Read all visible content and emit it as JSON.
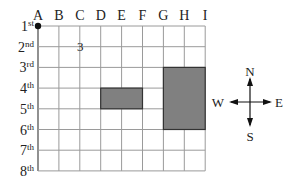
{
  "grid": {
    "columns": [
      "A",
      "B",
      "C",
      "D",
      "E",
      "F",
      "G",
      "H",
      "I"
    ],
    "rows": [
      {
        "num": "1",
        "suffix": "st"
      },
      {
        "num": "2",
        "suffix": "nd"
      },
      {
        "num": "3",
        "suffix": "rd"
      },
      {
        "num": "4",
        "suffix": "th"
      },
      {
        "num": "5",
        "suffix": "th"
      },
      {
        "num": "6",
        "suffix": "th"
      },
      {
        "num": "7",
        "suffix": "th"
      },
      {
        "num": "8",
        "suffix": "th"
      }
    ],
    "marker_label": "3",
    "origin_dot": "A 1st",
    "shaded_regions": [
      {
        "name": "rect-small",
        "from_col": "D",
        "to_col": "F",
        "from_row": "4th",
        "to_row": "5th"
      },
      {
        "name": "rect-large",
        "from_col": "G",
        "to_col": "I",
        "from_row": "3rd",
        "to_row": "6th"
      }
    ],
    "line_color": "#9a9a9a",
    "fill_color": "#808080"
  },
  "compass": {
    "north": "N",
    "south": "S",
    "east": "E",
    "west": "W"
  }
}
